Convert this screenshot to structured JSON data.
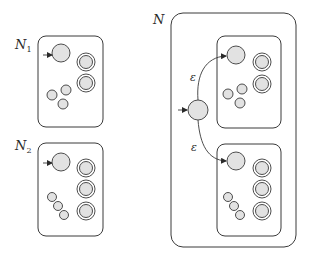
{
  "diagram": {
    "type": "NFA union construction",
    "colors": {
      "stroke": "#3a3a3a",
      "state_fill": "#e2e2e2",
      "background": "#ffffff"
    },
    "machines": [
      {
        "id": "N1",
        "label": "N",
        "subscript": "1",
        "start_states": 1,
        "accept_states": 2,
        "other_states": 3
      },
      {
        "id": "N2",
        "label": "N",
        "subscript": "2",
        "start_states": 1,
        "accept_states": 3,
        "other_states": 3
      },
      {
        "id": "N",
        "label": "N",
        "subscript": "",
        "new_start_state": 1,
        "contains": [
          "N1",
          "N2"
        ],
        "epsilon_transitions": [
          {
            "from": "new-start",
            "to": "N1-start",
            "label": "ε"
          },
          {
            "from": "new-start",
            "to": "N2-start",
            "label": "ε"
          }
        ]
      }
    ]
  }
}
